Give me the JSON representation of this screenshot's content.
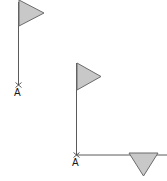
{
  "canvas": {
    "width": 167,
    "height": 181,
    "background": "#ffffff"
  },
  "style": {
    "stroke_color": "#5a5a5a",
    "stroke_width": 1,
    "triangle_fill": "#c8c8c8",
    "triangle_stroke": "#6b6b6b",
    "label_color": "#1a1a1a",
    "label_font_size": 10
  },
  "figures": [
    {
      "id": "figure-left",
      "name": "left-flag-vector",
      "pole": {
        "name": "vertical-ray",
        "x1": 18.5,
        "y1": 2,
        "x2": 18.5,
        "y2": 85
      },
      "flag": {
        "name": "right-pointing-triangle",
        "direction": "right",
        "points": "19,0 19,26 44,13",
        "label": "flag-head"
      },
      "vertex": {
        "name": "point-a",
        "label": "A",
        "x": 18.5,
        "y": 85,
        "label_x": 14,
        "label_y": 96,
        "tick_marks": true
      }
    },
    {
      "id": "figure-right",
      "name": "right-angle-vector-pair",
      "pole": {
        "name": "vertical-ray",
        "x1": 76.5,
        "y1": 63,
        "x2": 76.5,
        "y2": 155
      },
      "flag": {
        "name": "right-pointing-triangle",
        "direction": "right",
        "points": "77,63 77,90 101,76.5",
        "label": "flag-head"
      },
      "baseline": {
        "name": "horizontal-ray",
        "x1": 76.5,
        "y1": 155,
        "x2": 167,
        "y2": 155
      },
      "baseline_head": {
        "name": "down-pointing-triangle",
        "direction": "down",
        "points": "129,153 158,153 143.5,176",
        "label": "arrow-head"
      },
      "vertex": {
        "name": "point-a",
        "label": "A",
        "x": 76.5,
        "y": 155,
        "label_x": 72,
        "label_y": 166,
        "tick_marks": true
      }
    }
  ],
  "labels": {
    "left_vertex": "A",
    "right_vertex": "A"
  }
}
